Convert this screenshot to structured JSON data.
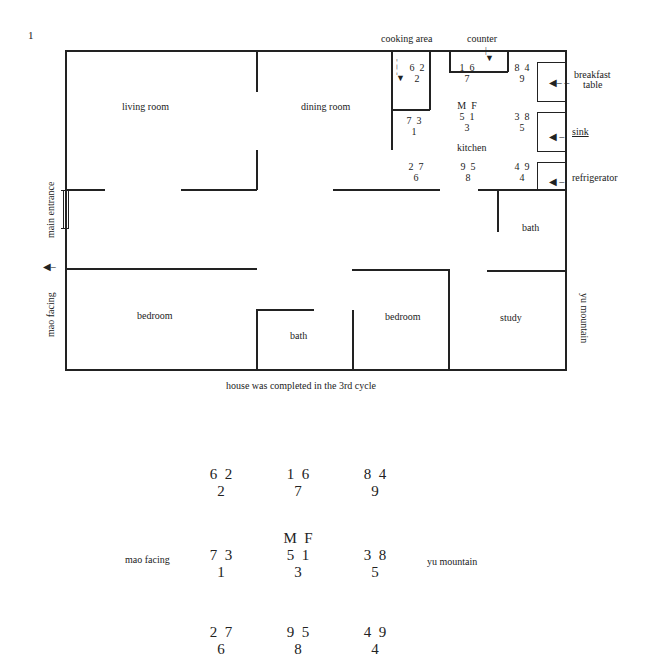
{
  "figure_number": "1",
  "floorplan": {
    "rooms": {
      "living_room": "living room",
      "dining_room": "dining room",
      "kitchen": "kitchen",
      "bath_right": "bath",
      "bedroom_left": "bedroom",
      "bath_lower": "bath",
      "bedroom_middle": "bedroom",
      "study": "study"
    },
    "fixtures": {
      "cooking_area": "cooking area",
      "counter": "counter",
      "breakfast_table_line1": "breakfast",
      "breakfast_table_line2": "table",
      "sink": "sink",
      "refrigerator": "refrigerator"
    },
    "side_labels": {
      "main_entrance": "main entrance",
      "mao_facing": "mao facing",
      "yu_mountain": "yu mountain"
    },
    "caption": "house was completed in the 3rd cycle",
    "stars": {
      "nw": {
        "top": "6  2",
        "bottom": "2"
      },
      "n": {
        "top": "1  6",
        "bottom": "7"
      },
      "ne": {
        "top": "8  4",
        "bottom": "9"
      },
      "w": {
        "top": "7  3",
        "bottom": "1"
      },
      "c": {
        "header": "M  F",
        "top": "5  1",
        "bottom": "3"
      },
      "e": {
        "top": "3  8",
        "bottom": "5"
      },
      "sw": {
        "top": "2  7",
        "bottom": "6"
      },
      "s": {
        "top": "9  5",
        "bottom": "8"
      },
      "se": {
        "top": "4  9",
        "bottom": "4"
      }
    }
  },
  "grid_chart": {
    "left_label": "mao facing",
    "right_label": "yu mountain",
    "header": "M  F",
    "cells": [
      {
        "top": "6  2",
        "bottom": "2"
      },
      {
        "top": "1  6",
        "bottom": "7"
      },
      {
        "top": "8  4",
        "bottom": "9"
      },
      {
        "top": "7  3",
        "bottom": "1"
      },
      {
        "top": "5  1",
        "bottom": "3"
      },
      {
        "top": "3  8",
        "bottom": "5"
      },
      {
        "top": "2  7",
        "bottom": "6"
      },
      {
        "top": "9  5",
        "bottom": "8"
      },
      {
        "top": "4  9",
        "bottom": "4"
      }
    ]
  }
}
